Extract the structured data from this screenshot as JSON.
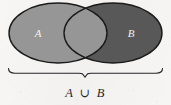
{
  "figure": {
    "background_color": "#f6f5f3",
    "outline_color": "#1a1a1a"
  },
  "sets": [
    {
      "id": "A",
      "label": "A",
      "fill_color": "#969696",
      "label_color": "#f2f2f0",
      "position": "left",
      "cx": 58,
      "cy": 33,
      "rx": 49,
      "ry": 30
    },
    {
      "id": "B",
      "label": "B",
      "fill_color": "#585858",
      "label_color": "#f2f2f0",
      "position": "right",
      "cx": 113,
      "cy": 33,
      "rx": 49,
      "ry": 30
    }
  ],
  "overlap": {
    "name": "intersection-lens",
    "fill_color": "#8e8e8e",
    "shaded": true
  },
  "brace": {
    "name": "underbrace",
    "left_x": 8,
    "right_x": 163,
    "y": 72,
    "cusp_x": 85,
    "color": "#26252a"
  },
  "caption": {
    "left_operand": "A",
    "operator": "∪",
    "right_operand": "B",
    "full_text": "A ∪ B",
    "color": "#26252a"
  }
}
